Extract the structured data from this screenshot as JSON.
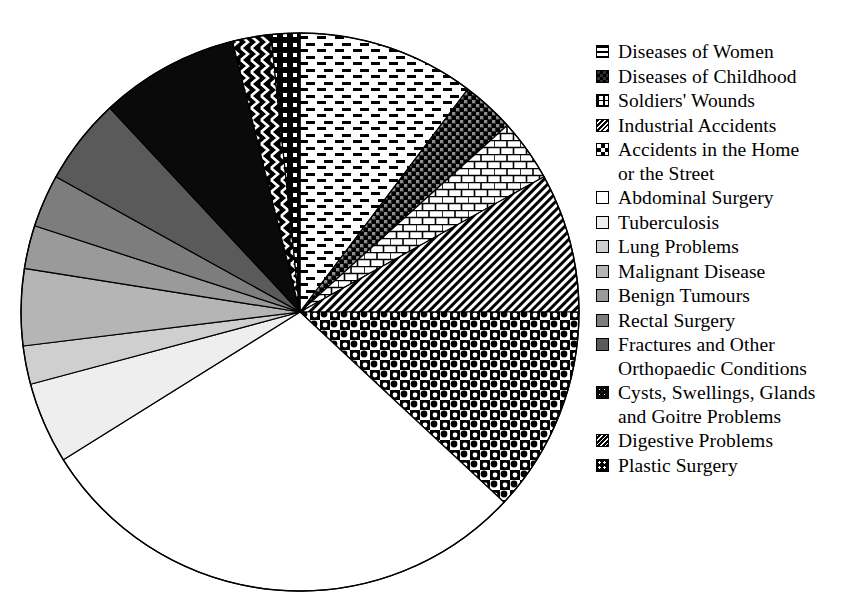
{
  "chart_data": {
    "type": "pie",
    "title": "",
    "legend_position": "right",
    "start_angle_deg": 0,
    "direction": "clockwise",
    "center": {
      "x": 300,
      "y": 312
    },
    "radius": 279,
    "categories": [
      "Diseases of Women",
      "Diseases of Childhood",
      "Soldiers' Wounds",
      "Industrial Accidents",
      "Accidents in the Home\nor the Street",
      "Abdominal Surgery",
      "Tuberculosis",
      "Lung Problems",
      "Malignant Disease",
      "Benign Tumours",
      "Rectal Surgery",
      "Fractures and Other\nOrthopaedic Conditions",
      "Cysts, Swellings, Glands\nand Goitre Problems",
      "Digestive Problems",
      "Plastic Surgery"
    ],
    "values": [
      10.3,
      3.1,
      3.6,
      8.1,
      11.9,
      29.2,
      4.7,
      2.2,
      4.4,
      2.5,
      3.1,
      5.0,
      8.1,
      2.2,
      1.6
    ],
    "angles_deg": [
      37.0,
      11.0,
      13.0,
      29.0,
      43.0,
      105.0,
      17.0,
      8.0,
      16.0,
      9.0,
      11.0,
      18.0,
      29.0,
      8.0,
      6.0
    ],
    "slices": [
      {
        "label": "Diseases of Women",
        "pattern": "horizontal-dashes",
        "fill": "#ffffff",
        "ink": "#000000",
        "percent": 10.3
      },
      {
        "label": "Diseases of Childhood",
        "pattern": "dark-check",
        "fill": "#3a3a3a",
        "ink": "#000000",
        "percent": 3.1
      },
      {
        "label": "Soldiers' Wounds",
        "pattern": "brick",
        "fill": "#ffffff",
        "ink": "#000000",
        "percent": 3.6
      },
      {
        "label": "Industrial Accidents",
        "pattern": "fine-diagonal",
        "fill": "#ffffff",
        "ink": "#000000",
        "percent": 8.1
      },
      {
        "label": "Accidents in the Home or the Street",
        "pattern": "bold-checker",
        "fill": "#ffffff",
        "ink": "#000000",
        "percent": 11.9
      },
      {
        "label": "Abdominal Surgery",
        "pattern": "solid",
        "fill": "#ffffff",
        "ink": "#000000",
        "percent": 29.2
      },
      {
        "label": "Tuberculosis",
        "pattern": "solid",
        "fill": "#eeeeee",
        "ink": "#000000",
        "percent": 4.7
      },
      {
        "label": "Lung Problems",
        "pattern": "solid",
        "fill": "#cfcfcf",
        "ink": "#000000",
        "percent": 2.2
      },
      {
        "label": "Malignant Disease",
        "pattern": "solid",
        "fill": "#b5b5b5",
        "ink": "#000000",
        "percent": 4.4
      },
      {
        "label": "Benign Tumours",
        "pattern": "solid",
        "fill": "#9a9a9a",
        "ink": "#000000",
        "percent": 2.5
      },
      {
        "label": "Rectal Surgery",
        "pattern": "solid",
        "fill": "#7d7d7d",
        "ink": "#000000",
        "percent": 3.1
      },
      {
        "label": "Fractures and Other Orthopaedic Conditions",
        "pattern": "solid",
        "fill": "#5a5a5a",
        "ink": "#000000",
        "percent": 5.0
      },
      {
        "label": "Cysts, Swellings, Glands and Goitre Problems",
        "pattern": "solid",
        "fill": "#0a0a0a",
        "ink": "#000000",
        "percent": 8.1
      },
      {
        "label": "Digestive Problems",
        "pattern": "zigzag",
        "fill": "#000000",
        "ink": "#ffffff",
        "percent": 2.2
      },
      {
        "label": "Plastic Surgery",
        "pattern": "dots-on-black",
        "fill": "#000000",
        "ink": "#ffffff",
        "percent": 1.6
      }
    ]
  },
  "legend": {
    "items": [
      {
        "label": "Diseases of Women",
        "swatch": "swatch-horizontal-dashes"
      },
      {
        "label": "Diseases of Childhood",
        "swatch": "swatch-dark-check"
      },
      {
        "label": "Soldiers' Wounds",
        "swatch": "swatch-brick"
      },
      {
        "label": "Industrial Accidents",
        "swatch": "swatch-fine-diagonal"
      },
      {
        "label": "Accidents in the Home\nor the Street",
        "swatch": "swatch-bold-checker"
      },
      {
        "label": "Abdominal Surgery",
        "swatch": "swatch-white"
      },
      {
        "label": "Tuberculosis",
        "swatch": "swatch-gray-eee"
      },
      {
        "label": "Lung Problems",
        "swatch": "swatch-gray-cfc"
      },
      {
        "label": "Malignant Disease",
        "swatch": "swatch-gray-b5b"
      },
      {
        "label": "Benign Tumours",
        "swatch": "swatch-gray-9a9"
      },
      {
        "label": "Rectal Surgery",
        "swatch": "swatch-gray-7d7"
      },
      {
        "label": "Fractures and Other\nOrthopaedic Conditions",
        "swatch": "swatch-gray-5a5"
      },
      {
        "label": "Cysts, Swellings, Glands\nand Goitre Problems",
        "swatch": "swatch-black"
      },
      {
        "label": "Digestive Problems",
        "swatch": "swatch-zigzag"
      },
      {
        "label": "Plastic Surgery",
        "swatch": "swatch-dots-on-black"
      }
    ]
  }
}
